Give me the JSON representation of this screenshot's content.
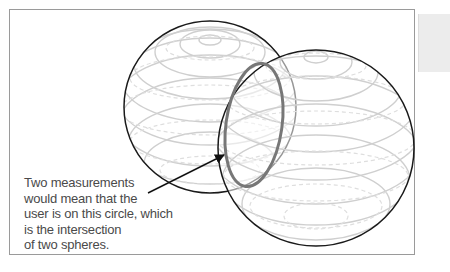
{
  "figure": {
    "caption_lines": [
      "Two measurements",
      "would mean that the",
      "user is on this circle, which",
      "is the intersection",
      "of two spheres."
    ],
    "elements": {
      "sphere_count": 2,
      "highlighted": "intersection circle of two spheres"
    },
    "colors": {
      "sphere_outline": "#1a1a1a",
      "latitude_lines": "#cfcfcf",
      "hidden_lines": "#dedede",
      "intersection_circle": "#777777",
      "caption_text": "#4a4a4a",
      "frame_border": "#9a9a9a",
      "side_tab": "#ececec"
    }
  }
}
